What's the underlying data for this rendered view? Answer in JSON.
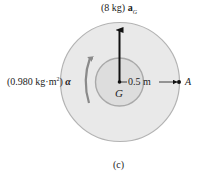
{
  "figure": {
    "caption": "(c)",
    "force_label": {
      "mass": "(8 kg)",
      "vector": "a",
      "subscript": "G"
    },
    "moment_label": {
      "inertia": "(0.980 kg·m",
      "exponent": "2",
      "close": ")",
      "symbol": "α"
    },
    "center_label": "G",
    "distance_label": "0.5 m",
    "point_label": "A"
  },
  "colors": {
    "outer_disk_fill": "#e9e9e9",
    "outer_disk_edge": "#b3b3b3",
    "inner_disk_fill": "#dddddd",
    "inner_disk_edge": "#a9a9a9",
    "arrow": "#111111",
    "curved_arrow": "#8a8a8a",
    "text": "#222222"
  }
}
